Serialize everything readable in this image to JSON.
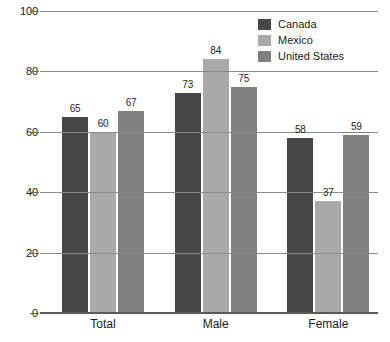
{
  "chart_data": {
    "type": "bar",
    "title": "",
    "subtitle": "",
    "xlabel": "",
    "ylabel": "",
    "categories": [
      "Total",
      "Male",
      "Female"
    ],
    "series": [
      {
        "name": "Canada",
        "color": "#474747",
        "values": [
          65,
          73,
          58
        ]
      },
      {
        "name": "Mexico",
        "color": "#a9a9a9",
        "values": [
          60,
          84,
          37
        ]
      },
      {
        "name": "United States",
        "color": "#808080",
        "values": [
          67,
          75,
          59
        ]
      }
    ],
    "ylim": [
      0,
      100
    ],
    "yticks": [
      0,
      20,
      40,
      60,
      80,
      100
    ],
    "ytick_labels": [
      "0",
      "20",
      "40",
      "60",
      "80",
      "100"
    ],
    "grid": true,
    "grid_axis": "y",
    "legend": true,
    "legend_position": "top-right",
    "data_labels": true,
    "background": "#ffffff",
    "grid_color": "#8a8a8a",
    "axis_color": "#5a5a5a",
    "text_color": "#1a1a1a"
  }
}
